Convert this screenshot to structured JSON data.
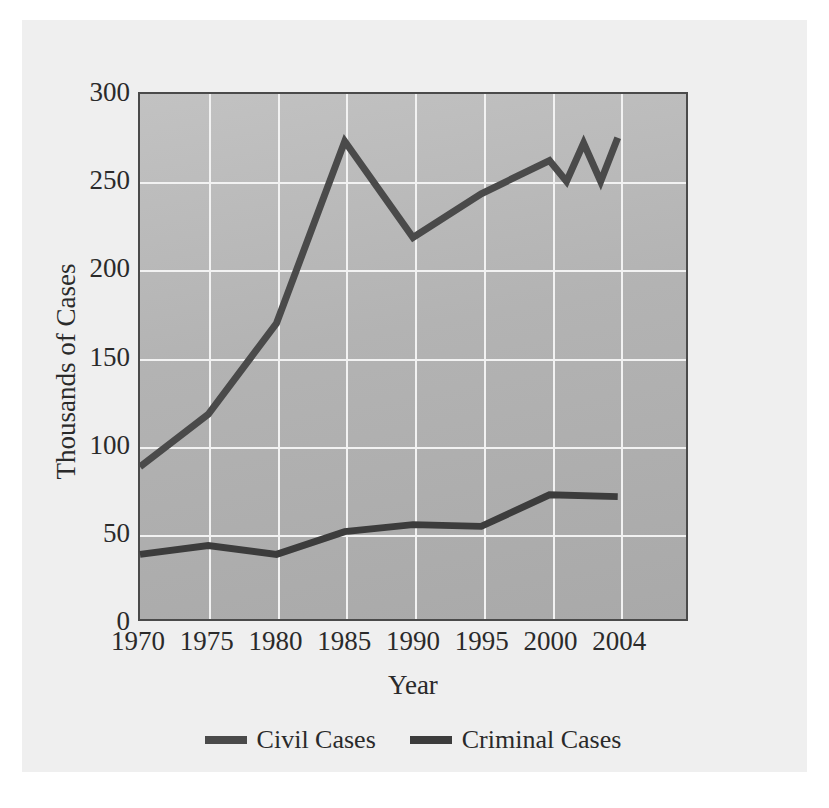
{
  "chart_data": {
    "type": "line",
    "title": "",
    "xlabel": "Year",
    "ylabel": "Thousands of Cases",
    "xlim": [
      1970,
      2004
    ],
    "ylim": [
      0,
      300
    ],
    "yticks": [
      0,
      50,
      100,
      150,
      200,
      250,
      300
    ],
    "ytick_labels": [
      "0",
      "50",
      "100",
      "150",
      "200",
      "250",
      "300"
    ],
    "xticks": [
      1970,
      1975,
      1980,
      1985,
      1990,
      1995,
      2000,
      2004
    ],
    "xtick_labels": [
      "1970",
      "1975",
      "1980",
      "1985",
      "1990",
      "1995",
      "2000",
      "2004"
    ],
    "grid": true,
    "legend_position": "bottom",
    "series": [
      {
        "name": "Civil Cases",
        "color": "#4a4a4a",
        "x": [
          1970,
          1975,
          1980,
          1985,
          1990,
          1995,
          2000,
          2001,
          2002,
          2003,
          2004
        ],
        "values": [
          87,
          117,
          169,
          273,
          218,
          243,
          262,
          250,
          272,
          250,
          275
        ]
      },
      {
        "name": "Criminal Cases",
        "color": "#3c3c3c",
        "x": [
          1970,
          1975,
          1980,
          1985,
          1990,
          1995,
          2000,
          2004
        ],
        "values": [
          37,
          42,
          37,
          50,
          54,
          53,
          71,
          70
        ]
      }
    ]
  },
  "legend": {
    "items": [
      {
        "label": "Civil Cases"
      },
      {
        "label": "Criminal Cases"
      }
    ]
  },
  "axes": {
    "x_title": "Year",
    "y_title": "Thousands of Cases"
  },
  "colors": {
    "figure_background": "#efefef",
    "plot_background": "#b4b4b4",
    "gridline": "#f2f2f2",
    "axis_frame": "#4a4a4a",
    "series_line": "#4a4a4a",
    "text": "#2a2a2a"
  }
}
